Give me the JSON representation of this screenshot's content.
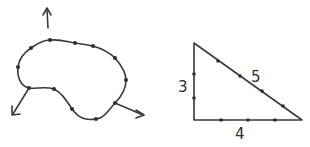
{
  "figures": {
    "blob": {
      "description": "closed curve with marked points and three outward arrows",
      "points": [
        [
          50,
          40
        ],
        [
          75,
          43
        ],
        [
          93,
          46
        ],
        [
          115,
          58
        ],
        [
          126,
          80
        ],
        [
          115,
          103
        ],
        [
          96,
          119
        ],
        [
          72,
          109
        ],
        [
          54,
          89
        ],
        [
          29,
          88
        ],
        [
          18,
          67
        ],
        [
          31,
          48
        ]
      ],
      "arrows": [
        {
          "from": [
            49,
            28
          ],
          "to": [
            47,
            8
          ]
        },
        {
          "from": [
            29,
            88
          ],
          "to": [
            12,
            115
          ]
        },
        {
          "from": [
            115,
            103
          ],
          "to": [
            144,
            115
          ]
        }
      ]
    },
    "triangle": {
      "vertices": [
        [
          194,
          43
        ],
        [
          194,
          120
        ],
        [
          302,
          120
        ]
      ],
      "labels": {
        "vertical_side": "3",
        "hypotenuse": "5",
        "horizontal_side": "4"
      },
      "tick_marks": {
        "vertical": 2,
        "horizontal": 3,
        "hypotenuse": 4
      }
    }
  }
}
